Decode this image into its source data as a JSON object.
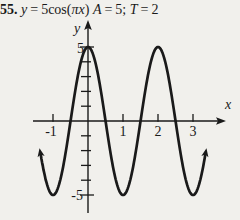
{
  "page": {
    "background": "#f1f0ec",
    "ink": "#1a1a1a"
  },
  "header": {
    "problem_number": "55.",
    "equation": {
      "lhs": "y",
      "equals": "=",
      "coefficient": "5",
      "function": "cos",
      "open_paren": "(",
      "argument": "πx",
      "close_paren": ")"
    },
    "amplitude": {
      "symbol": "A",
      "equals": "=",
      "value": "5;"
    },
    "period": {
      "symbol": "T",
      "equals": "=",
      "value": "2"
    }
  },
  "graph": {
    "x_axis_label": "x",
    "y_axis_label": "y",
    "x_tick_labels": [
      "-1",
      "1",
      "2",
      "3"
    ],
    "y_tick_labels": [
      "5",
      "-5"
    ]
  },
  "chart_data": {
    "type": "line",
    "function": "y = 5*cos(pi*x)",
    "amplitude": 5,
    "period": 2,
    "phase_shift": 0,
    "x_domain": [
      -1.35,
      3.35
    ],
    "xlim": [
      -1.6,
      3.9
    ],
    "ylim": [
      -6.3,
      6.8
    ],
    "x_ticks": [
      -1,
      1,
      2,
      3
    ],
    "y_minor_ticks": [
      -5,
      -4,
      -3,
      -2,
      -1,
      1,
      2,
      3,
      4,
      5
    ],
    "y_labeled_ticks": [
      5,
      -5
    ],
    "key_points": [
      {
        "x": -1,
        "y": -5
      },
      {
        "x": -0.5,
        "y": 0
      },
      {
        "x": 0,
        "y": 5
      },
      {
        "x": 0.5,
        "y": 0
      },
      {
        "x": 1,
        "y": -5
      },
      {
        "x": 1.5,
        "y": 0
      },
      {
        "x": 2,
        "y": 5
      },
      {
        "x": 2.5,
        "y": 0
      },
      {
        "x": 3,
        "y": -5
      }
    ],
    "grid": false,
    "legend": false,
    "end_arrows": true
  }
}
